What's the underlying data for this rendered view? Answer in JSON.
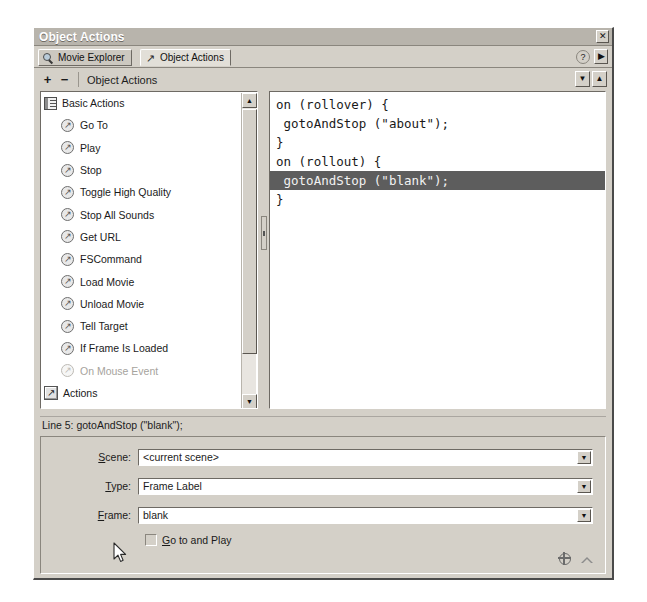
{
  "window": {
    "title": "Object Actions",
    "close_label": "✕"
  },
  "tabs": [
    {
      "label": "Movie Explorer",
      "icon": "magnifier-icon",
      "active": false
    },
    {
      "label": "Object Actions",
      "icon": "action-arrow-icon",
      "active": true
    }
  ],
  "tab_controls": {
    "help_label": "?",
    "panel_arrow_label": "▶"
  },
  "toolbar": {
    "add_label": "+",
    "remove_label": "−",
    "title": "Object Actions",
    "down_label": "▼",
    "up_label": "▲"
  },
  "tree": {
    "scroll": {
      "up_label": "▲",
      "down_label": "▼"
    },
    "items": [
      {
        "label": "Basic Actions",
        "icon": "book-icon",
        "type": "group",
        "dim": false
      },
      {
        "label": "Go To",
        "icon": "action-circle-icon",
        "type": "child",
        "dim": false
      },
      {
        "label": "Play",
        "icon": "action-circle-icon",
        "type": "child",
        "dim": false
      },
      {
        "label": "Stop",
        "icon": "action-circle-icon",
        "type": "child",
        "dim": false
      },
      {
        "label": "Toggle High Quality",
        "icon": "action-circle-icon",
        "type": "child",
        "dim": false
      },
      {
        "label": "Stop All Sounds",
        "icon": "action-circle-icon",
        "type": "child",
        "dim": false
      },
      {
        "label": "Get URL",
        "icon": "action-circle-icon",
        "type": "child",
        "dim": false
      },
      {
        "label": "FSCommand",
        "icon": "action-circle-icon",
        "type": "child",
        "dim": false
      },
      {
        "label": "Load Movie",
        "icon": "action-circle-icon",
        "type": "child",
        "dim": false
      },
      {
        "label": "Unload Movie",
        "icon": "action-circle-icon",
        "type": "child",
        "dim": false
      },
      {
        "label": "Tell Target",
        "icon": "action-circle-icon",
        "type": "child",
        "dim": false
      },
      {
        "label": "If Frame Is Loaded",
        "icon": "action-circle-icon",
        "type": "child",
        "dim": false
      },
      {
        "label": "On Mouse Event",
        "icon": "action-circle-icon",
        "type": "child",
        "dim": true
      },
      {
        "label": "Actions",
        "icon": "action-square-icon",
        "type": "group",
        "dim": false
      },
      {
        "label": "Operators",
        "icon": "action-square-icon",
        "type": "group",
        "dim": false
      }
    ],
    "icon_glyph": "↗"
  },
  "code": {
    "lines": [
      {
        "text": "on (rollover) {",
        "selected": false
      },
      {
        "text": " gotoAndStop (\"about\");",
        "selected": false
      },
      {
        "text": "}",
        "selected": false
      },
      {
        "text": "on (rollout) {",
        "selected": false
      },
      {
        "text": " gotoAndStop (\"blank\");",
        "selected": true
      },
      {
        "text": "}",
        "selected": false
      }
    ]
  },
  "status": {
    "text": "Line 5: gotoAndStop (\"blank\");"
  },
  "params": {
    "fields": [
      {
        "name": "scene",
        "label_pre": "",
        "label_key": "S",
        "label_post": "cene:",
        "value": "<current scene>",
        "arrow": "▼"
      },
      {
        "name": "type",
        "label_pre": "",
        "label_key": "T",
        "label_post": "ype:",
        "value": "Frame Label",
        "arrow": "▼"
      },
      {
        "name": "frame",
        "label_pre": "",
        "label_key": "F",
        "label_post": "rame:",
        "value": "blank",
        "arrow": "▼"
      }
    ],
    "checkbox": {
      "label_key": "G",
      "label_post": "o to and Play",
      "checked": false
    }
  },
  "colors": {
    "window_face": "#d4d0c8",
    "titlebar": "#b8b4ac",
    "code_selection": "#5d5d5d",
    "tab_active": "#e2dfd8",
    "text": "#1a1a1a",
    "dim_text": "#a6a39d"
  }
}
